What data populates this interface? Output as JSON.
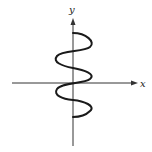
{
  "diagram": {
    "type": "coordinate-sketch",
    "axes": {
      "x_label": "x",
      "y_label": "y"
    },
    "colors": {
      "curve": "#1a1a1a",
      "axis": "#333333",
      "background": "#ffffff"
    }
  }
}
